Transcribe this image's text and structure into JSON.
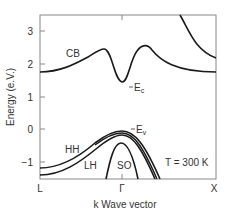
{
  "axes": {
    "ylabel": "Energy (e.V.)",
    "xlabel": "k Wave vector",
    "yticks": [
      "3",
      "2",
      "1",
      "0",
      "−1"
    ],
    "xticks": [
      "L",
      "Γ",
      "X"
    ]
  },
  "bands": {
    "cb": "CB",
    "ec": "E",
    "ec_sub": "c",
    "ev": "E",
    "ev_sub": "v",
    "hh": "HH",
    "lh": "LH",
    "so": "SO"
  },
  "annotation": {
    "temperature": "T = 300 K"
  },
  "colors": {
    "curve": "#1a1a1a",
    "frame": "#888888",
    "text": "#333333"
  }
}
